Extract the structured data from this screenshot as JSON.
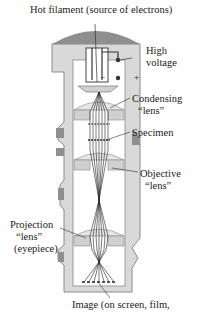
{
  "diagram": {
    "labels": {
      "filament": "Hot filament (source of electrons)",
      "high_voltage_1": "High",
      "high_voltage_2": "voltage",
      "condensing_1": "Condensing",
      "condensing_2": "“lens”",
      "specimen": "Specimen",
      "objective_1": "Objective",
      "objective_2": "“lens”",
      "projection_1": "Projection",
      "projection_2": "“lens”",
      "projection_3": "(eyepiece)",
      "image": "Image (on screen, film,"
    },
    "signs": {
      "minus": "−",
      "plus": "+"
    },
    "colors": {
      "body_fill": "#d9d9d9",
      "body_stroke": "#8a8a8a",
      "cap_fill": "#8f8f8f",
      "lens_fill": "#e6e6e6",
      "beam": "#222222",
      "inner": "#ffffff"
    }
  }
}
